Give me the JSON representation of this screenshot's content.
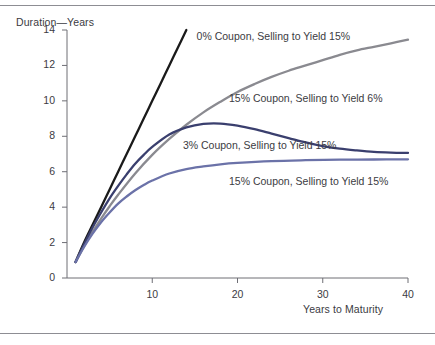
{
  "figure": {
    "name": "bond-duration-vs-maturity-figure",
    "rules": [
      "top-rule",
      "bottom-rule"
    ]
  },
  "chart_data": {
    "type": "line",
    "title": "",
    "subtitle": "",
    "xlabel": "Years to Maturity",
    "ylabel": "Duration—Years",
    "xlim": [
      0,
      40
    ],
    "ylim": [
      0,
      14
    ],
    "grid": false,
    "legend_position": "inline-annotations",
    "x_ticks": [
      10,
      20,
      30,
      40
    ],
    "x_tick_labels": [
      "10",
      "20",
      "30",
      "40"
    ],
    "y_ticks": [
      0,
      2,
      4,
      6,
      8,
      10,
      12,
      14
    ],
    "y_tick_labels": [
      "0",
      "2",
      "4",
      "6",
      "8",
      "10",
      "12",
      "14"
    ],
    "series": [
      {
        "name": "0% Coupon, Selling to Yield 15%",
        "label": "0% Coupon, Selling to Yield 15%",
        "color": "#1a1a1a",
        "width": 2.3,
        "label_x": 15.2,
        "label_y": 13.6,
        "x": [
          1,
          2,
          3,
          4,
          5,
          6,
          7,
          8,
          9,
          10,
          11,
          12,
          13,
          14
        ],
        "y": [
          0.9,
          2.0,
          3.0,
          4.0,
          5.0,
          6.0,
          7.0,
          8.0,
          9.0,
          10.0,
          11.0,
          12.0,
          13.0,
          14.0
        ]
      },
      {
        "name": "15% Coupon, Selling to Yield 6%",
        "label": "15% Coupon, Selling to Yield 6%",
        "color": "#8a8a90",
        "width": 2.3,
        "label_x": 19.0,
        "label_y": 10.1,
        "x": [
          1,
          2,
          3,
          4,
          5,
          6,
          8,
          10,
          12,
          14,
          16,
          18,
          20,
          22,
          24,
          26,
          28,
          30,
          32,
          34,
          36,
          38,
          40
        ],
        "y": [
          0.9,
          1.8,
          2.6,
          3.35,
          4.05,
          4.7,
          5.9,
          6.95,
          7.85,
          8.65,
          9.35,
          9.95,
          10.5,
          10.95,
          11.35,
          11.7,
          12.0,
          12.3,
          12.6,
          12.85,
          13.05,
          13.25,
          13.45
        ]
      },
      {
        "name": "3% Coupon, Selling to Yield 15%",
        "label": "3% Coupon, Selling to Yield 15%",
        "color": "#3a3f6e",
        "width": 2.3,
        "label_x": 13.6,
        "label_y": 7.45,
        "x": [
          1,
          2,
          3,
          4,
          5,
          6,
          7,
          8,
          9,
          10,
          12,
          14,
          16,
          18,
          20,
          22,
          24,
          26,
          28,
          30,
          32,
          34,
          36,
          38,
          40
        ],
        "y": [
          0.9,
          1.9,
          2.85,
          3.7,
          4.5,
          5.2,
          5.85,
          6.45,
          6.95,
          7.4,
          8.1,
          8.5,
          8.7,
          8.72,
          8.6,
          8.4,
          8.15,
          7.9,
          7.65,
          7.45,
          7.3,
          7.2,
          7.12,
          7.08,
          7.06
        ]
      },
      {
        "name": "15% Coupon, Selling to Yield 15%",
        "label": "15% Coupon, Selling to Yield 15%",
        "color": "#6b72a8",
        "width": 2.3,
        "label_x": 19.0,
        "label_y": 5.45,
        "x": [
          1,
          2,
          3,
          4,
          5,
          6,
          7,
          8,
          9,
          10,
          12,
          14,
          16,
          18,
          20,
          24,
          28,
          32,
          36,
          40
        ],
        "y": [
          0.9,
          1.75,
          2.5,
          3.15,
          3.7,
          4.2,
          4.6,
          4.95,
          5.25,
          5.5,
          5.9,
          6.15,
          6.3,
          6.42,
          6.5,
          6.6,
          6.65,
          6.68,
          6.69,
          6.7
        ]
      }
    ]
  }
}
